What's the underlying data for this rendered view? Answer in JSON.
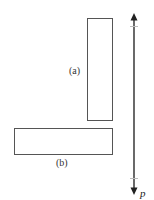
{
  "diagram": {
    "rect_a": {
      "label": "(a)",
      "x": 87,
      "y": 18,
      "w": 25,
      "h": 102
    },
    "rect_b": {
      "label": "(b)",
      "x": 14,
      "y": 128,
      "w": 98,
      "h": 26
    },
    "axis": {
      "label": "p",
      "x": 134,
      "y_top": 14,
      "y_bottom": 194,
      "tick_top": 26,
      "tick_bottom": 178
    },
    "colors": {
      "stroke": "#555555",
      "axis": "#444444"
    }
  }
}
